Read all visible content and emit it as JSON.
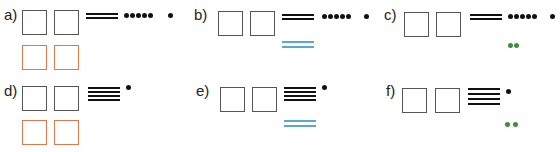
{
  "exercises": [
    {
      "label": "a)",
      "tens_lines": 2,
      "ones_dots": 6,
      "answer": "orange-boxes"
    },
    {
      "label": "b)",
      "tens_lines": 2,
      "ones_dots": 6,
      "answer": "blue-lines",
      "answer_count": 2
    },
    {
      "label": "c)",
      "tens_lines": 2,
      "ones_dots": 6,
      "answer": "green-dots",
      "answer_count": 2
    },
    {
      "label": "d)",
      "tens_lines": 4,
      "ones_dots": 1,
      "answer": "orange-boxes"
    },
    {
      "label": "e)",
      "tens_lines": 4,
      "ones_dots": 1,
      "answer": "blue-lines",
      "answer_count": 2
    },
    {
      "label": "f)",
      "tens_lines": 4,
      "ones_dots": 1,
      "answer": "green-dots",
      "answer_count": 2
    }
  ],
  "colors": {
    "box_border": "#555555",
    "answer_box_border": "#e0784e",
    "blue_lines": "#5aa6d6",
    "green_dots": "#3d8f3a",
    "ink": "#111111"
  }
}
